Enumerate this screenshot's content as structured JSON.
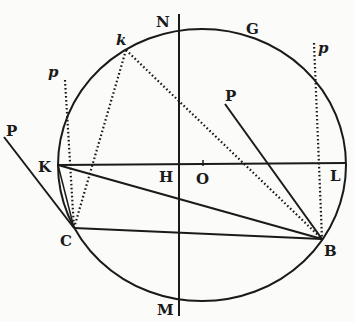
{
  "figure": {
    "colors": {
      "ink": "#1a1a1a",
      "paper": "#fbfbf9"
    },
    "circle": {
      "cx": 202,
      "cy": 165,
      "rx": 144,
      "ry": 136
    },
    "labels": {
      "N": "N",
      "G": "G",
      "k": "k",
      "p_left": "p",
      "p_right": "p",
      "P_outer": "P",
      "P_inner": "P",
      "K": "K",
      "H": "H",
      "O": "O",
      "L": "L",
      "C": "C",
      "B": "B",
      "M": "M"
    },
    "points": {
      "K": [
        58,
        165
      ],
      "L": [
        346,
        163
      ],
      "C": [
        74,
        228
      ],
      "B": [
        322,
        239
      ],
      "k": [
        126,
        50
      ],
      "O": [
        203,
        164
      ]
    }
  }
}
